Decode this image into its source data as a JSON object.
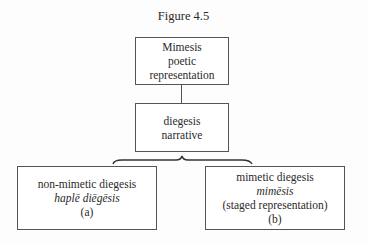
{
  "figure": {
    "title": "Figure 4.5"
  },
  "nodes": {
    "root": {
      "lines": [
        "Mimesis",
        "poetic",
        "representation"
      ]
    },
    "middle": {
      "lines": [
        "diegesis",
        "narrative"
      ]
    },
    "left": {
      "lines": [
        "non-mimetic diegesis",
        "haplē diēgēsis",
        "(a)"
      ],
      "italic_line_index": 1
    },
    "right": {
      "lines": [
        "mimetic diegesis",
        "mimēsis",
        "(staged representation)",
        "(b)"
      ],
      "italic_line_index": 1
    }
  },
  "edges": [
    {
      "from": "root",
      "to": "middle",
      "type": "line"
    },
    {
      "from": "middle",
      "to": [
        "left",
        "right"
      ],
      "type": "brace"
    }
  ],
  "colors": {
    "stroke": "#555555",
    "text": "#2a2a2a",
    "background": "#fdfdfd"
  }
}
